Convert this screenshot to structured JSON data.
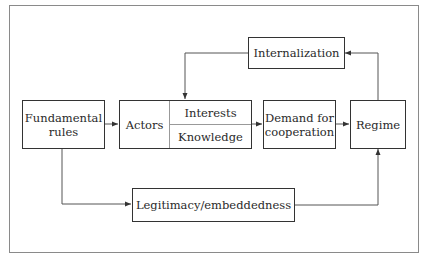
{
  "diagram": {
    "nodes": {
      "fundamental_rules": {
        "label": "Fundamental\nrules",
        "line1": "Fundamental",
        "line2": "rules"
      },
      "actors": {
        "label": "Actors",
        "sub_top": "Interests",
        "sub_bottom": "Knowledge"
      },
      "demand": {
        "label": "Demand for cooperation",
        "line1": "Demand for",
        "line2": "cooperation"
      },
      "regime": {
        "label": "Regime"
      },
      "internalization": {
        "label": "Internalization"
      },
      "legitimacy": {
        "label": "Legitimacy/embeddedness"
      }
    },
    "edges": [
      {
        "from": "fundamental_rules",
        "to": "actors"
      },
      {
        "from": "actors",
        "to": "demand"
      },
      {
        "from": "demand",
        "to": "regime"
      },
      {
        "from": "regime",
        "to": "internalization"
      },
      {
        "from": "internalization",
        "to": "actors"
      },
      {
        "from": "fundamental_rules",
        "to": "legitimacy"
      },
      {
        "from": "legitimacy",
        "to": "regime"
      }
    ],
    "colors": {
      "stroke": "#333333",
      "frame": "#8a8a8a",
      "background": "#ffffff"
    }
  }
}
